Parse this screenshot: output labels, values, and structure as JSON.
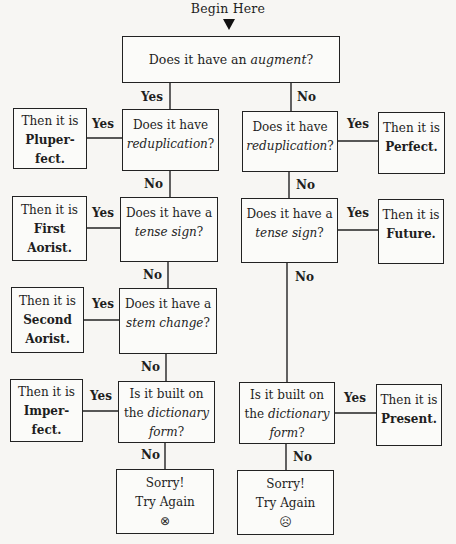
{
  "title": "Begin Here",
  "edge_labels": {
    "yes": "Yes",
    "no": "No"
  },
  "nodes": {
    "augment": {
      "pre": "Does it have an ",
      "term": "augment",
      "post": "?"
    },
    "left": {
      "reduplication": {
        "line1": "Does it have",
        "term": "reduplication",
        "post": "?"
      },
      "tense_sign": {
        "line1": "Does it have a",
        "term": "tense sign",
        "post": "?"
      },
      "stem_change": {
        "line1": "Does it have a",
        "term": "stem change",
        "post": "?"
      },
      "dictionary_form": {
        "line1": "Is it built on",
        "line2_pre": "the ",
        "term1": "dictionary",
        "term2": "form",
        "post": "?"
      },
      "sorry": {
        "line1": "Sorry!",
        "line2": "Try Again",
        "face": "⊗"
      }
    },
    "right": {
      "reduplication": {
        "line1": "Does it have",
        "term": "reduplication",
        "post": "?"
      },
      "tense_sign": {
        "line1": "Does it have a",
        "term": "tense sign",
        "post": "?"
      },
      "dictionary_form": {
        "line1": "Is it built on",
        "line2_pre": "the ",
        "term1": "dictionary",
        "term2": "form",
        "post": "?"
      },
      "sorry": {
        "line1": "Sorry!",
        "line2": "Try Again",
        "face": "☹"
      }
    },
    "results": {
      "pluperfect": {
        "prefix": "Then it is",
        "line1": "Pluper-",
        "line2": "fect."
      },
      "first_aorist": {
        "prefix": "Then it is",
        "line1": "First",
        "line2": "Aorist."
      },
      "second_aorist": {
        "prefix": "Then it is",
        "line1": "Second",
        "line2": "Aorist."
      },
      "imperfect": {
        "prefix": "Then it is",
        "line1": "Imper-",
        "line2": "fect."
      },
      "perfect": {
        "prefix": "Then it is",
        "line1": "Perfect."
      },
      "future": {
        "prefix": "Then it is",
        "line1": "Future."
      },
      "present": {
        "prefix": "Then it is",
        "line1": "Present."
      }
    }
  }
}
